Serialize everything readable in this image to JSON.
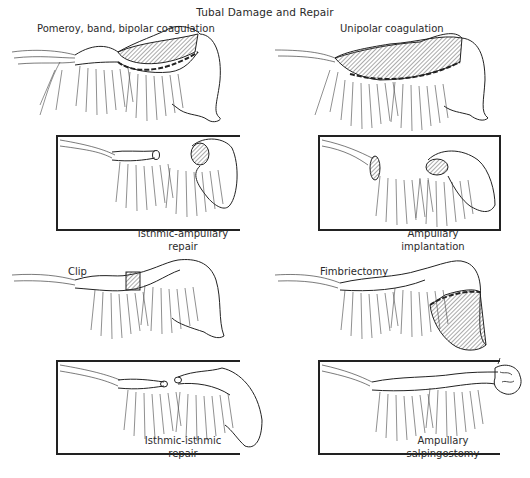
{
  "figure": {
    "title": "Tubal Damage and Repair",
    "colors": {
      "ink": "#222222",
      "hatch": "#555555",
      "background": "#ffffff"
    }
  },
  "panels": [
    {
      "id": "pomeroy",
      "damage_label": "Pomeroy, band, bipolar coagulation",
      "repair_caption_line1": "Isthmic-ampullary",
      "repair_caption_line2": "repair"
    },
    {
      "id": "unipolar",
      "damage_label": "Unipolar coagulation",
      "repair_caption_line1": "Ampullary",
      "repair_caption_line2": "implantation"
    },
    {
      "id": "clip",
      "damage_label": "Clip",
      "repair_caption_line1": "Isthmic-isthmic",
      "repair_caption_line2": "repair"
    },
    {
      "id": "fimbriectomy",
      "damage_label": "Fimbriectomy",
      "repair_caption_line1": "Ampullary",
      "repair_caption_line2": "salpingostomy"
    }
  ]
}
